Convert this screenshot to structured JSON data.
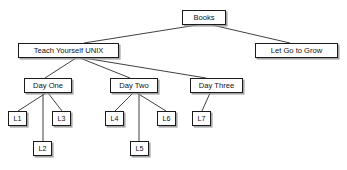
{
  "diagram": {
    "type": "tree-diagram",
    "canvas": {
      "width": 347,
      "height": 170
    },
    "style": {
      "background_color": "#ffffff",
      "node_fill": "#ffffff",
      "node_border_color": "#1b1b1b",
      "node_shadow_color": "#969696",
      "edge_color": "#2b2b2b",
      "text_color": "#111111"
    },
    "nodes": [
      {
        "id": "books",
        "label": "Books",
        "x": 182,
        "y": 10,
        "w": 44,
        "h": 15,
        "font_size": 7.6,
        "level": 0
      },
      {
        "id": "tyunix",
        "label": "Teach Yourself UNIX",
        "x": 18,
        "y": 43,
        "w": 101,
        "h": 15,
        "font_size": 7.6,
        "level": 1
      },
      {
        "id": "letgo",
        "label": "Let Go to Grow",
        "x": 255,
        "y": 43,
        "w": 83,
        "h": 15,
        "font_size": 7.6,
        "level": 1
      },
      {
        "id": "day1",
        "label": "Day One",
        "x": 24,
        "y": 78,
        "w": 48,
        "h": 15,
        "font_size": 7.6,
        "level": 2
      },
      {
        "id": "day2",
        "label": "Day Two",
        "x": 110,
        "y": 78,
        "w": 48,
        "h": 15,
        "font_size": 7.6,
        "level": 2
      },
      {
        "id": "day3",
        "label": "Day Three",
        "x": 190,
        "y": 78,
        "w": 53,
        "h": 15,
        "font_size": 7.6,
        "level": 2
      },
      {
        "id": "l1",
        "label": "L1",
        "x": 8,
        "y": 111,
        "w": 19,
        "h": 15,
        "font_size": 7.2,
        "level": 3
      },
      {
        "id": "l3",
        "label": "L3",
        "x": 52,
        "y": 111,
        "w": 19,
        "h": 15,
        "font_size": 7.2,
        "level": 3
      },
      {
        "id": "l2",
        "label": "L2",
        "x": 33,
        "y": 141,
        "w": 19,
        "h": 15,
        "font_size": 7.2,
        "level": 4
      },
      {
        "id": "l4",
        "label": "L4",
        "x": 105,
        "y": 111,
        "w": 19,
        "h": 15,
        "font_size": 7.2,
        "level": 3
      },
      {
        "id": "l6",
        "label": "L6",
        "x": 157,
        "y": 111,
        "w": 19,
        "h": 15,
        "font_size": 7.2,
        "level": 3
      },
      {
        "id": "l5",
        "label": "L5",
        "x": 130,
        "y": 141,
        "w": 19,
        "h": 15,
        "font_size": 7.2,
        "level": 4
      },
      {
        "id": "l7",
        "label": "L7",
        "x": 192,
        "y": 111,
        "w": 19,
        "h": 15,
        "font_size": 7.2,
        "level": 3
      }
    ],
    "edges": [
      {
        "id": "e-books-tyunix",
        "from": "books",
        "to": "tyunix",
        "x1": 197,
        "y1": 25,
        "x2": 84,
        "y2": 43
      },
      {
        "id": "e-books-letgo",
        "from": "books",
        "to": "letgo",
        "x1": 212,
        "y1": 25,
        "x2": 290,
        "y2": 43
      },
      {
        "id": "e-tyunix-day1",
        "from": "tyunix",
        "to": "day1",
        "x1": 76,
        "y1": 58,
        "x2": 45,
        "y2": 78
      },
      {
        "id": "e-tyunix-day2",
        "from": "tyunix",
        "to": "day2",
        "x1": 80,
        "y1": 58,
        "x2": 130,
        "y2": 78
      },
      {
        "id": "e-tyunix-day3",
        "from": "tyunix",
        "to": "day3",
        "x1": 84,
        "y1": 58,
        "x2": 206,
        "y2": 78
      },
      {
        "id": "e-day1-l1",
        "from": "day1",
        "to": "l1",
        "x1": 46,
        "y1": 93,
        "x2": 18,
        "y2": 111
      },
      {
        "id": "e-day1-l3",
        "from": "day1",
        "to": "l3",
        "x1": 48,
        "y1": 93,
        "x2": 62,
        "y2": 111
      },
      {
        "id": "e-day1-l2",
        "from": "day1",
        "to": "l2",
        "x1": 43,
        "y1": 93,
        "x2": 43,
        "y2": 141
      },
      {
        "id": "e-day2-l4",
        "from": "day2",
        "to": "l4",
        "x1": 133,
        "y1": 93,
        "x2": 115,
        "y2": 111
      },
      {
        "id": "e-day2-l6",
        "from": "day2",
        "to": "l6",
        "x1": 137,
        "y1": 93,
        "x2": 166,
        "y2": 111
      },
      {
        "id": "e-day2-l5",
        "from": "day2",
        "to": "l5",
        "x1": 139,
        "y1": 93,
        "x2": 139,
        "y2": 141
      },
      {
        "id": "e-day3-l7",
        "from": "day3",
        "to": "l7",
        "x1": 210,
        "y1": 93,
        "x2": 202,
        "y2": 111
      }
    ]
  }
}
